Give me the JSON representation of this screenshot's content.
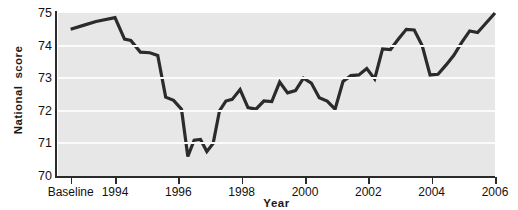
{
  "chart_data": {
    "type": "line",
    "title": "",
    "xlabel": "Year",
    "ylabel": "National  score",
    "ylim": [
      70,
      75
    ],
    "xlim": [
      1992.6,
      2006.4
    ],
    "grid": true,
    "legend": null,
    "y_ticks": [
      75,
      74,
      73,
      72,
      71,
      70
    ],
    "x_ticks": [
      {
        "label": "Baseline",
        "value": 1993.0
      },
      {
        "label": "1994",
        "value": 1994.4
      },
      {
        "label": "1996",
        "value": 1996.4
      },
      {
        "label": "1998",
        "value": 1998.4
      },
      {
        "label": "2000",
        "value": 2000.4
      },
      {
        "label": "2002",
        "value": 2002.4
      },
      {
        "label": "2004",
        "value": 2004.4
      },
      {
        "label": "2006",
        "value": 2006.4
      }
    ],
    "series": [
      {
        "name": "National score",
        "color": "#2b2b2b",
        "x": [
          1993.0,
          1993.4,
          1993.8,
          1994.4,
          1994.7,
          1994.9,
          1995.2,
          1995.5,
          1995.75,
          1996.0,
          1996.25,
          1996.5,
          1996.7,
          1996.9,
          1997.1,
          1997.3,
          1997.5,
          1997.7,
          1997.9,
          1998.1,
          1998.35,
          1998.6,
          1998.85,
          1999.1,
          1999.35,
          1999.6,
          1999.85,
          2000.1,
          2000.35,
          2000.6,
          2000.85,
          2001.1,
          2001.35,
          2001.6,
          2001.85,
          2002.1,
          2002.35,
          2002.6,
          2002.85,
          2003.1,
          2003.35,
          2003.6,
          2003.85,
          2004.1,
          2004.35,
          2004.6,
          2004.85,
          2005.1,
          2005.35,
          2005.6,
          2005.85,
          2006.4
        ],
        "y": [
          74.5,
          74.62,
          74.74,
          74.86,
          74.2,
          74.16,
          73.8,
          73.78,
          73.7,
          72.42,
          72.32,
          72.05,
          70.6,
          71.1,
          71.12,
          70.75,
          71.0,
          72.0,
          72.3,
          72.35,
          72.65,
          72.1,
          72.05,
          72.3,
          72.28,
          72.88,
          72.55,
          72.62,
          73.0,
          72.85,
          72.4,
          72.3,
          72.05,
          72.9,
          73.08,
          73.1,
          73.3,
          72.98,
          73.9,
          73.88,
          74.2,
          74.5,
          74.48,
          74.0,
          73.1,
          73.12,
          73.4,
          73.7,
          74.1,
          74.45,
          74.4,
          75.0
        ]
      }
    ]
  }
}
